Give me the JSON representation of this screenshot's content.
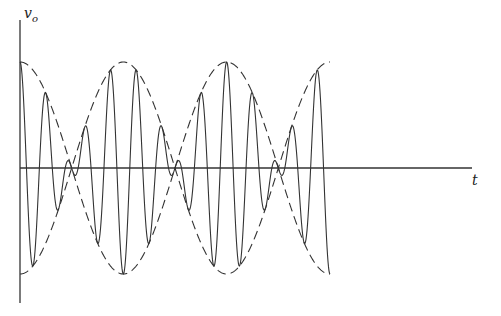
{
  "figure": {
    "y_axis_label": "v",
    "y_axis_subscript": "o",
    "x_axis_label": "t"
  },
  "chart_data": {
    "type": "line",
    "title": "",
    "xlabel": "t",
    "ylabel": "v_o",
    "series": [
      {
        "name": "v_o(t)",
        "style": "solid",
        "form": "A·cos(ω_m t)·cos(ω_c t)"
      },
      {
        "name": "upper envelope",
        "style": "dashed",
        "form": "A·cos(ω_m t)"
      },
      {
        "name": "lower envelope",
        "style": "dashed",
        "form": "-A·cos(ω_m t)"
      }
    ],
    "envelope_half_periods_shown": 3,
    "carrier_to_envelope_ratio": 8,
    "grid": false,
    "legend": false
  },
  "colors": {
    "line": "#333333",
    "background": "#ffffff"
  }
}
